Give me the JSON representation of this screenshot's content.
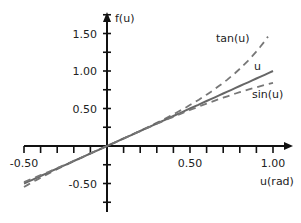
{
  "chart_data": {
    "type": "line",
    "title": "",
    "xlabel": "u(rad)",
    "ylabel": "f(u)",
    "xlim": [
      -0.5,
      1.0
    ],
    "ylim": [
      -0.75,
      1.75
    ],
    "grid": false,
    "legend": "inline labels at curve ends",
    "x_ticks": {
      "step": 0.1,
      "labels": [
        {
          "value": -0.5,
          "text": "-0.50"
        },
        {
          "value": 0.5,
          "text": "0.50"
        },
        {
          "value": 1.0,
          "text": "1.00"
        }
      ]
    },
    "y_ticks": {
      "step": 0.25,
      "labels": [
        {
          "value": 1.5,
          "text": "1.50"
        },
        {
          "value": 1.0,
          "text": "1.00"
        },
        {
          "value": 0.5,
          "text": "0.50"
        },
        {
          "value": -0.5,
          "text": "-0.50"
        }
      ]
    },
    "series": [
      {
        "name": "tan(u)",
        "style": "dashed",
        "color": "#777777",
        "u_range": [
          -0.5,
          0.97
        ],
        "x": [
          -0.5,
          -0.25,
          0,
          0.25,
          0.5,
          0.75,
          0.97
        ],
        "values": [
          -0.55,
          -0.26,
          0,
          0.26,
          0.55,
          0.93,
          1.46
        ]
      },
      {
        "name": "u",
        "style": "solid",
        "color": "#666666",
        "u_range": [
          -0.5,
          1.0
        ],
        "x": [
          -0.5,
          0,
          0.5,
          1.0
        ],
        "values": [
          -0.5,
          0,
          0.5,
          1.0
        ]
      },
      {
        "name": "sin(u)",
        "style": "dashed",
        "color": "#777777",
        "u_range": [
          -0.5,
          1.0
        ],
        "x": [
          -0.5,
          -0.25,
          0,
          0.25,
          0.5,
          0.75,
          1.0
        ],
        "values": [
          -0.48,
          -0.25,
          0,
          0.25,
          0.48,
          0.68,
          0.84
        ]
      }
    ],
    "annotations": [
      {
        "text": "tan(u)",
        "x": 216,
        "y": 42
      },
      {
        "text": "u",
        "x": 254,
        "y": 70
      },
      {
        "text": "sin(u)",
        "x": 252,
        "y": 98
      }
    ]
  },
  "geometry": {
    "origin_x": 107,
    "origin_y": 146,
    "px_per_unit_x": 166,
    "px_per_unit_y": 75,
    "x_axis_left": 24,
    "x_axis_right": 293,
    "y_axis_top": 12,
    "y_axis_bottom": 212
  }
}
